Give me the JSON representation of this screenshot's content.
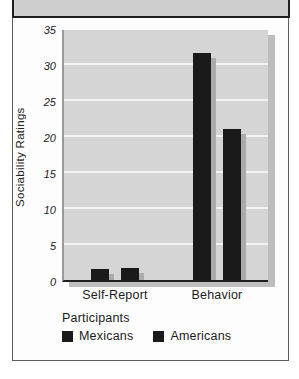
{
  "chart_data": {
    "type": "bar",
    "title": "",
    "categories": [
      "Self-Report",
      "Behavior"
    ],
    "series": [
      {
        "name": "Mexicans",
        "values": [
          1.5,
          31.5
        ],
        "color": "#1a1a1a"
      },
      {
        "name": "Americans",
        "values": [
          1.7,
          21
        ],
        "color": "#1a1a1a"
      }
    ],
    "xlabel": "",
    "ylabel": "Sociability Ratings",
    "ylim": [
      0,
      35
    ],
    "yticks": [
      35,
      30,
      25,
      20,
      15,
      10,
      5,
      0
    ],
    "grid": true,
    "gridline_color": "#f3f3f3",
    "plot_bg": "#d5d5d5",
    "bar_color": "#1a1a1a",
    "legend": {
      "title": "Participants",
      "position": "bottom-left",
      "items": [
        "Mexicans",
        "Americans"
      ]
    }
  }
}
